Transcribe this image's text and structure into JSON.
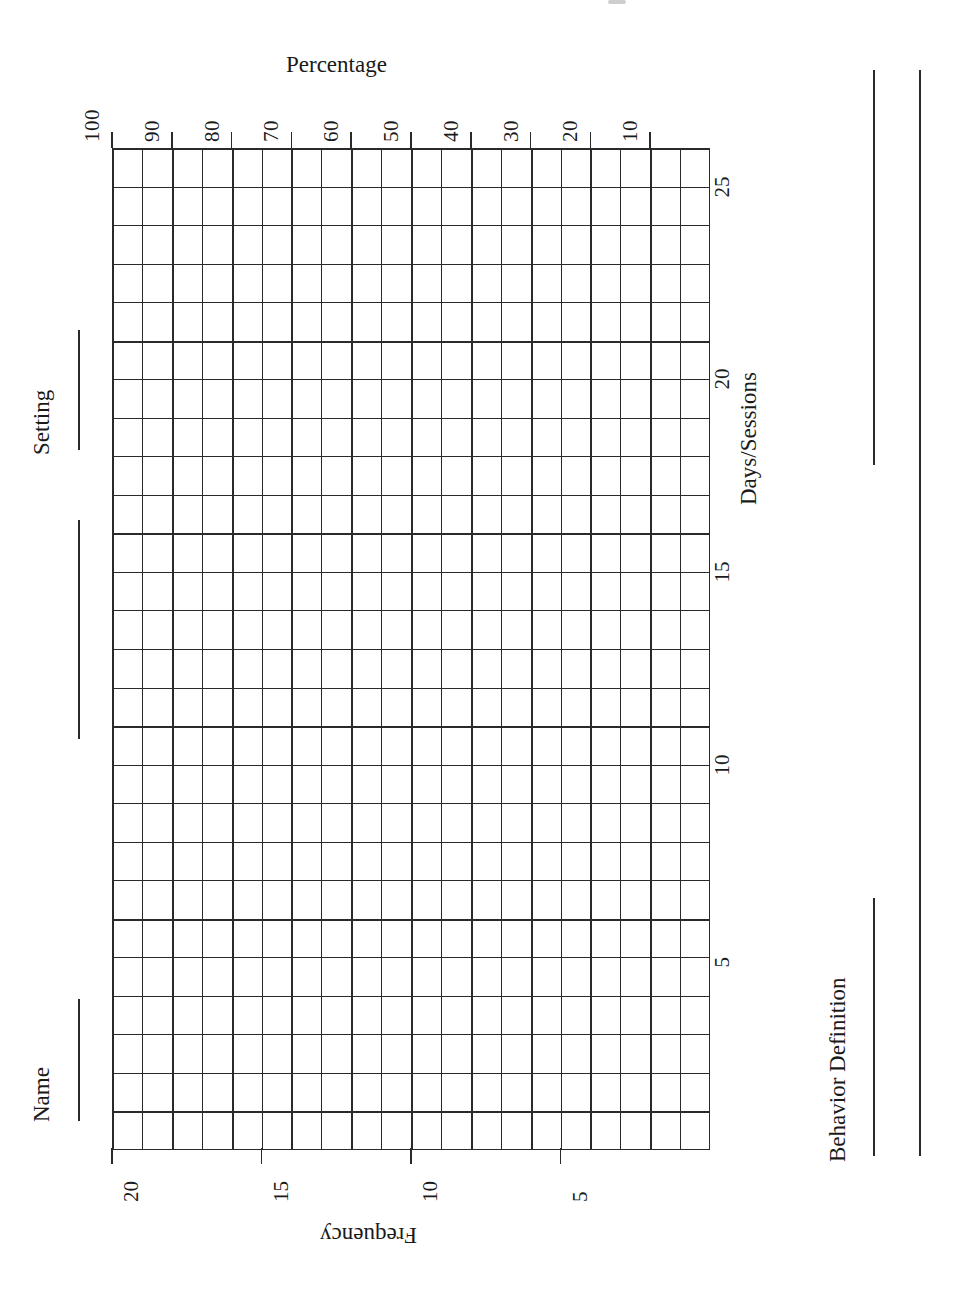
{
  "sheet": {
    "orientation": "landscape-rotated-90",
    "paper_color": "#ffffff",
    "ink_color": "#2a2a2a"
  },
  "fields": [
    {
      "id": "name",
      "label": "Name"
    },
    {
      "id": "setting",
      "label": "Setting"
    },
    {
      "id": "behavior",
      "label": "Behavior Definition"
    }
  ],
  "field_labels": {
    "name": "Name",
    "setting": "Setting",
    "behavior": "Behavior Definition"
  },
  "axes": {
    "percentage": {
      "title": "Percentage",
      "ticks": [
        "100",
        "90",
        "80",
        "70",
        "60",
        "50",
        "40",
        "30",
        "20",
        "10"
      ]
    },
    "frequency": {
      "title": "Frequency",
      "ticks": [
        "20",
        "15",
        "10",
        "5"
      ]
    },
    "days": {
      "title": "Days/Sessions",
      "ticks": [
        "25",
        "20",
        "15",
        "10",
        "5"
      ]
    }
  },
  "chart_data": {
    "type": "table",
    "title": "Percentage",
    "subtitle": "",
    "xlabel": "Percentage",
    "ylabel": "Days/Sessions",
    "secondary_xlabel": "Frequency",
    "grid": true,
    "legend": "none",
    "columns": 20,
    "rows": 26,
    "series": [
      {
        "name": "plotted data",
        "values": []
      }
    ],
    "x": [],
    "categories": [],
    "values": [],
    "percentage_axis": {
      "label": "Percentage",
      "tick_labels": [
        "100",
        "90",
        "80",
        "70",
        "60",
        "50",
        "40",
        "30",
        "20",
        "10"
      ],
      "tick_values": [
        100,
        90,
        80,
        70,
        60,
        50,
        40,
        30,
        20,
        10
      ],
      "range": [
        0,
        100
      ],
      "cells": 20,
      "cell_step": 5,
      "major_every_cells": 2,
      "position": "top",
      "direction": "100-at-left-descending-to-right"
    },
    "frequency_axis": {
      "label": "Frequency",
      "tick_labels": [
        "20",
        "15",
        "10",
        "5"
      ],
      "tick_values": [
        20,
        15,
        10,
        5
      ],
      "range": [
        0,
        20
      ],
      "cells": 20,
      "cell_step": 1,
      "major_every_cells": 5,
      "position": "bottom",
      "direction": "20-at-left-descending-to-right"
    },
    "days_axis": {
      "label": "Days/Sessions",
      "tick_labels": [
        "25",
        "20",
        "15",
        "10",
        "5"
      ],
      "tick_values": [
        25,
        20,
        15,
        10,
        5
      ],
      "range": [
        0,
        26
      ],
      "cells": 26,
      "cell_step": 1,
      "major_every_cells": 5,
      "position": "right",
      "direction": "25-at-top-descending-to-bottom"
    }
  }
}
